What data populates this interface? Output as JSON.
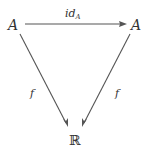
{
  "diagram": {
    "type": "commutative-triangle",
    "nodes": {
      "top_left": {
        "label": "A"
      },
      "top_right": {
        "label": "A"
      },
      "bottom": {
        "label": "ℝ"
      }
    },
    "edges": {
      "top": {
        "from": "top_left",
        "to": "top_right",
        "label_main": "id",
        "label_sub": "A"
      },
      "left": {
        "from": "top_left",
        "to": "bottom",
        "label": "f"
      },
      "right": {
        "from": "top_right",
        "to": "bottom",
        "label": "f"
      }
    },
    "colors": {
      "ink": "#333333",
      "arrow": "#555555",
      "background": "#ffffff"
    }
  }
}
